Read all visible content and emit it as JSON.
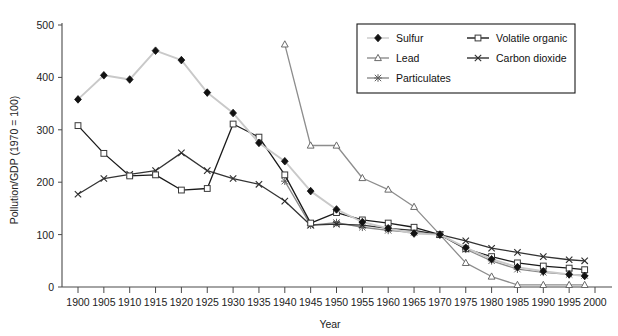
{
  "chart_data": {
    "type": "line",
    "title": "",
    "xlabel": "Year",
    "ylabel": "Pollution/GDP (1970 = 100)",
    "xlim": [
      1900,
      2000
    ],
    "ylim": [
      0,
      500
    ],
    "yticks": [
      0,
      100,
      200,
      300,
      400,
      500
    ],
    "xticks": [
      1900,
      1905,
      1910,
      1915,
      1920,
      1925,
      1930,
      1935,
      1940,
      1945,
      1950,
      1955,
      1960,
      1965,
      1970,
      1975,
      1980,
      1985,
      1990,
      1995,
      2000
    ],
    "grid": false,
    "legend_position": "top-right",
    "series": [
      {
        "name": "Sulfur",
        "marker": "diamond",
        "color": "#111111",
        "line_color": "#c9c9c9",
        "x": [
          1900,
          1905,
          1910,
          1915,
          1920,
          1925,
          1930,
          1935,
          1940,
          1945,
          1950,
          1955,
          1960,
          1965,
          1970,
          1975,
          1980,
          1985,
          1990,
          1995,
          1998
        ],
        "values": [
          358,
          404,
          396,
          451,
          433,
          371,
          332,
          275,
          240,
          183,
          148,
          124,
          112,
          102,
          100,
          75,
          53,
          38,
          30,
          24,
          21
        ]
      },
      {
        "name": "Volatile organic",
        "marker": "square",
        "color": "#555555",
        "line_color": "#1a1a1a",
        "x": [
          1900,
          1905,
          1910,
          1915,
          1920,
          1925,
          1930,
          1935,
          1940,
          1945,
          1950,
          1955,
          1960,
          1965,
          1970,
          1975,
          1980,
          1985,
          1990,
          1995,
          1998
        ],
        "values": [
          308,
          255,
          212,
          214,
          185,
          188,
          311,
          286,
          214,
          122,
          142,
          128,
          122,
          114,
          100,
          73,
          58,
          46,
          40,
          36,
          33
        ]
      },
      {
        "name": "Lead",
        "marker": "triangle",
        "color": "#777777",
        "line_color": "#8d8d8d",
        "x": [
          1940,
          1945,
          1950,
          1955,
          1960,
          1965,
          1970,
          1975,
          1980,
          1985,
          1990,
          1995,
          1998
        ],
        "values": [
          463,
          270,
          270,
          208,
          186,
          153,
          100,
          46,
          20,
          4,
          4,
          4,
          4
        ]
      },
      {
        "name": "Carbon dioxide",
        "marker": "x",
        "color": "#333333",
        "line_color": "#333333",
        "x": [
          1900,
          1905,
          1910,
          1915,
          1920,
          1925,
          1930,
          1935,
          1940,
          1945,
          1950,
          1955,
          1960,
          1965,
          1970,
          1975,
          1980,
          1985,
          1990,
          1995,
          1998
        ],
        "values": [
          177,
          207,
          215,
          222,
          256,
          222,
          207,
          196,
          164,
          118,
          120,
          118,
          112,
          108,
          100,
          88,
          74,
          66,
          58,
          52,
          50
        ]
      },
      {
        "name": "Particulates",
        "marker": "star",
        "color": "#6f6f6f",
        "line_color": "#8a8a8a",
        "x": [
          1940,
          1945,
          1950,
          1955,
          1960,
          1965,
          1970,
          1975,
          1980,
          1985,
          1990,
          1995,
          1998
        ],
        "values": [
          202,
          118,
          123,
          114,
          108,
          104,
          100,
          72,
          50,
          34,
          28,
          24,
          22
        ]
      }
    ]
  },
  "axes": {
    "y_title": "Pollution/GDP (1970 = 100)",
    "x_title": "Year",
    "y_tick_labels": [
      "500",
      "400",
      "300",
      "200",
      "100",
      "0"
    ],
    "x_tick_labels": [
      "1900",
      "1905",
      "1910",
      "1915",
      "1920",
      "1925",
      "1930",
      "1935",
      "1940",
      "1945",
      "1950",
      "1955",
      "1960",
      "1965",
      "1970",
      "1975",
      "1980",
      "1985",
      "1990",
      "1995",
      "2000"
    ]
  },
  "legend": {
    "entries": [
      {
        "label": "Sulfur",
        "marker": "diamond"
      },
      {
        "label": "Volatile organic",
        "marker": "square"
      },
      {
        "label": "Lead",
        "marker": "triangle"
      },
      {
        "label": "Carbon dioxide",
        "marker": "x"
      },
      {
        "label": "Particulates",
        "marker": "star"
      }
    ]
  }
}
